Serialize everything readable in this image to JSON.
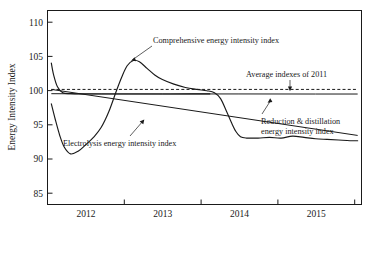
{
  "chart_data": {
    "type": "line",
    "title": "",
    "xlabel": "",
    "ylabel": "Energy Intensity Index",
    "ylim": [
      82.5,
      112
    ],
    "xlim": [
      2011.5,
      2015.6
    ],
    "grid": false,
    "legend_position": "inline-annotations",
    "ytick_labels": [
      "85",
      "90",
      "95",
      "100",
      "105",
      "110"
    ],
    "ytick_values": [
      85,
      90,
      95,
      100,
      105,
      110
    ],
    "xtick_labels": [
      "2012",
      "2013",
      "2014",
      "2015"
    ],
    "xtick_values": [
      2012,
      2013,
      2014,
      2015
    ],
    "annotations": [
      "Comprehensive energy intensity index",
      "Average indexes of 2011",
      "Reduction & distillation energy intensity index",
      "Electrolysis energy intensity index"
    ],
    "series": [
      {
        "name": "Comprehensive energy intensity index",
        "style": "solid",
        "x": [
          2011.55,
          2011.6,
          2011.66,
          2011.72,
          2011.8,
          2011.9,
          2012.0,
          2012.1,
          2012.2,
          2012.3,
          2012.4,
          2012.47,
          2012.54,
          2012.62,
          2012.7,
          2012.8,
          2012.9,
          2013.0,
          2013.15,
          2013.3,
          2013.45,
          2013.58,
          2013.68,
          2013.76,
          2013.84,
          2013.9,
          2013.96,
          2014.02,
          2014.1,
          2014.25,
          2014.4,
          2014.55,
          2014.7,
          2014.85,
          2015.0,
          2015.15,
          2015.3,
          2015.45,
          2015.55
        ],
        "y": [
          97.8,
          95.5,
          93.0,
          91.2,
          90.2,
          90.6,
          91.6,
          92.7,
          94.2,
          96.6,
          99.8,
          101.9,
          103.6,
          104.4,
          104.2,
          103.2,
          102.2,
          101.5,
          100.8,
          100.3,
          100.0,
          99.8,
          99.5,
          98.6,
          96.6,
          95.0,
          93.6,
          92.8,
          92.6,
          92.6,
          92.7,
          92.6,
          92.9,
          92.7,
          92.5,
          92.4,
          92.3,
          92.2,
          92.2
        ]
      },
      {
        "name": "Comprehensive energy intensity index initial spike",
        "style": "solid",
        "x": [
          2011.55,
          2011.58,
          2011.63,
          2011.7,
          2011.8,
          2011.95,
          2012.15,
          2012.45,
          2012.9,
          2013.4,
          2013.62
        ],
        "y": [
          104.0,
          102.2,
          100.4,
          99.5,
          99.35,
          99.3,
          99.3,
          99.3,
          99.3,
          99.32,
          99.33
        ]
      },
      {
        "name": "Electrolysis energy intensity index",
        "style": "solid",
        "x": [
          2011.55,
          2015.55
        ],
        "y": [
          100.0,
          93.0
        ]
      },
      {
        "name": "Reduction & distillation energy intensity index",
        "style": "solid",
        "x": [
          2011.55,
          2012.2,
          2013.0,
          2014.0,
          2015.0,
          2015.55
        ],
        "y": [
          99.35,
          99.32,
          99.31,
          99.31,
          99.3,
          99.3
        ]
      },
      {
        "name": "Average indexes of 2011",
        "style": "dashed",
        "x": [
          2011.55,
          2015.55
        ],
        "y": [
          100.0,
          100.0
        ]
      }
    ]
  },
  "axis": {
    "y_title": "Energy Intensity Index",
    "y_ticks": [
      "110",
      "105",
      "100",
      "95",
      "90",
      "85"
    ],
    "x_ticks": [
      "2012",
      "2013",
      "2014",
      "2015"
    ]
  },
  "labels": {
    "comprehensive": "Comprehensive energy intensity index",
    "average_2011": "Average indexes of 2011",
    "reduction_line1": "Reduction & distillation",
    "reduction_line2": "energy intensity index",
    "electrolysis": "Electrolysis energy intensity index"
  }
}
